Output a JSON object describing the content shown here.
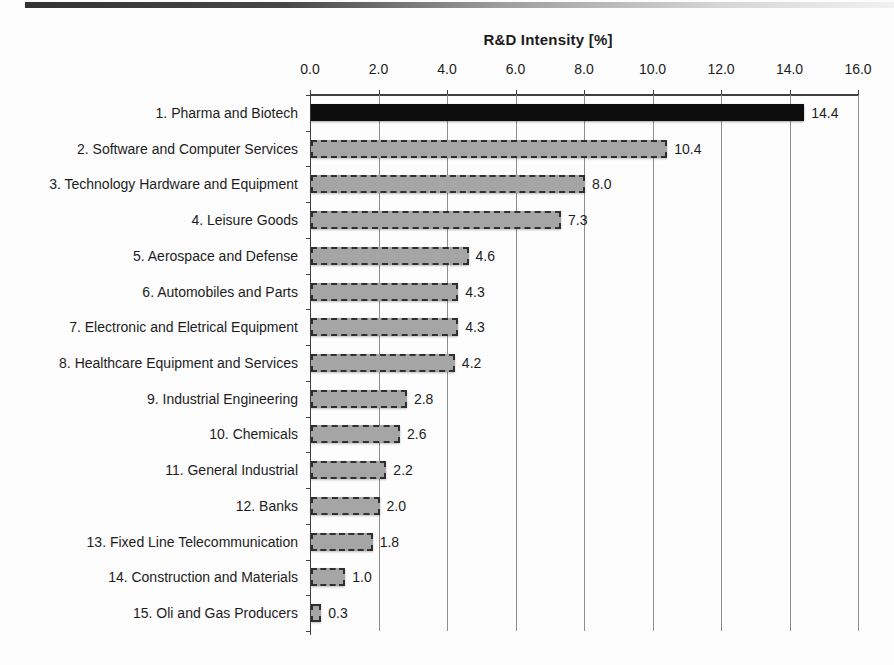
{
  "chart_data": {
    "type": "bar",
    "orientation": "horizontal",
    "title": "R&D Intensity [%]",
    "categories": [
      "1. Pharma and Biotech",
      "2. Software and Computer Services",
      "3. Technology Hardware and Equipment",
      "4. Leisure Goods",
      "5. Aerospace and Defense",
      "6. Automobiles and Parts",
      "7. Electronic and Eletrical Equipment",
      "8. Healthcare Equipment and Services",
      "9. Industrial Engineering",
      "10. Chemicals",
      "11. General Industrial",
      "12. Banks",
      "13. Fixed Line Telecommunication",
      "14. Construction and Materials",
      "15. Oli and Gas Producers"
    ],
    "values": [
      14.4,
      10.4,
      8.0,
      7.3,
      4.6,
      4.3,
      4.3,
      4.2,
      2.8,
      2.6,
      2.2,
      2.0,
      1.8,
      1.0,
      0.3
    ],
    "value_labels": [
      "14.4",
      "10.4",
      "8.0",
      "7.3",
      "4.6",
      "4.3",
      "4.3",
      "4.2",
      "2.8",
      "2.6",
      "2.2",
      "2.0",
      "1.8",
      "1.0",
      "0.3"
    ],
    "xlim": [
      0,
      16
    ],
    "x_ticks": [
      "0.0",
      "2.0",
      "4.0",
      "6.0",
      "8.0",
      "10.0",
      "12.0",
      "14.0",
      "16.0"
    ],
    "x_axis_position": "top",
    "grid": true,
    "legend_position": "none",
    "highlight_index": 0,
    "colors": {
      "highlight_bar": "#0d0d0d",
      "bar_fill": "#a5a5a5",
      "bar_border": "#2f2f2f",
      "gridline": "#8d8d8d",
      "axis": "#3f3f3f",
      "text": "#1c1c1c"
    }
  }
}
